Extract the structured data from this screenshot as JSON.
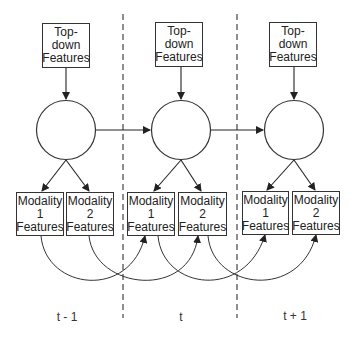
{
  "diagram": {
    "type": "temporal graphical model",
    "columns": [
      {
        "time_label": "t - 1",
        "top_box": [
          "Top-",
          "down",
          "Features"
        ],
        "modality_boxes": [
          [
            "Modality",
            "1",
            "Features"
          ],
          [
            "Modality",
            "2",
            "Features"
          ]
        ]
      },
      {
        "time_label": "t",
        "top_box": [
          "Top-",
          "down",
          "Features"
        ],
        "modality_boxes": [
          [
            "Modality",
            "1",
            "Features"
          ],
          [
            "Modality",
            "2",
            "Features"
          ]
        ]
      },
      {
        "time_label": "t + 1",
        "top_box": [
          "Top-",
          "down",
          "Features"
        ],
        "modality_boxes": [
          [
            "Modality",
            "1",
            "Features"
          ],
          [
            "Modality",
            "2",
            "Features"
          ]
        ]
      }
    ],
    "edges": [
      "top-down -> hidden state (each time step)",
      "hidden state -> modality 1 & modality 2 (each time step)",
      "hidden state(t-1) -> hidden state(t)",
      "hidden state(t) -> hidden state(t+1)",
      "modality 1(t-1) -> modality 1(t)",
      "modality 2(t-1) -> modality 2(t)",
      "modality 1(t) -> modality 1(t+1)",
      "modality 2(t) -> modality 2(t+1)"
    ],
    "colors": {
      "stroke": "#333333",
      "background": "#ffffff"
    }
  }
}
